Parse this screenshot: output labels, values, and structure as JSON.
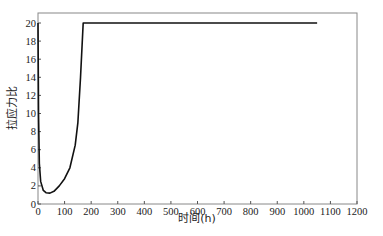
{
  "chart_data": {
    "type": "line",
    "title": "",
    "xlabel": "时间(h)",
    "ylabel": "拉应力比",
    "xlim": [
      0,
      1200
    ],
    "ylim": [
      0,
      20
    ],
    "xticks": [
      0,
      100,
      200,
      300,
      400,
      500,
      600,
      700,
      800,
      900,
      1000,
      1100,
      1200
    ],
    "yticks": [
      0,
      2,
      4,
      6,
      8,
      10,
      12,
      14,
      16,
      18,
      20
    ],
    "grid": false,
    "legend": null,
    "series": [
      {
        "name": "拉应力比",
        "color": "#111111",
        "x": [
          0,
          2,
          5,
          10,
          20,
          30,
          45,
          60,
          80,
          100,
          120,
          140,
          150,
          160,
          170,
          1050
        ],
        "y": [
          20,
          10,
          4.5,
          2.5,
          1.5,
          1.25,
          1.2,
          1.4,
          2.0,
          2.8,
          4.0,
          6.5,
          9,
          14,
          20,
          20
        ]
      }
    ]
  },
  "axes": {
    "x_title": "时间(h)",
    "y_title": "拉应力比"
  }
}
